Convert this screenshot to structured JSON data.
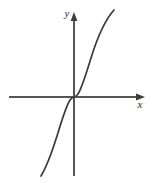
{
  "figure": {
    "title": "",
    "width": 153,
    "height": 183,
    "background_color": "#ffffff"
  },
  "axes": {
    "x_axis": {
      "label": "x",
      "label_style": "italic",
      "color": "#555555",
      "arrow": "right",
      "origin_y": 97,
      "start_x": 9,
      "end_x": 145,
      "label_x": 140,
      "label_y": 108
    },
    "y_axis": {
      "label": "y",
      "label_style": "italic",
      "color": "#555555",
      "arrow": "up",
      "origin_x": 74,
      "start_y": 176,
      "end_y": 12,
      "label_x": 67,
      "label_y": 17
    }
  },
  "chart_data": {
    "type": "line",
    "title": "",
    "xlabel": "x",
    "ylabel": "y",
    "grid": false,
    "legend": null,
    "curve_color": "#3a3a3a",
    "curve_width": 1.7,
    "function": "y = x^3",
    "xlim": [
      -3.3,
      4.0
    ],
    "ylim": [
      -8.5,
      8.7
    ],
    "x": [
      -2.05,
      -1.9,
      -1.75,
      -1.6,
      -1.45,
      -1.3,
      -1.15,
      -1.0,
      -0.85,
      -0.7,
      -0.55,
      -0.4,
      -0.25,
      0.0,
      0.25,
      0.4,
      0.55,
      0.7,
      0.85,
      1.0,
      1.15,
      1.3,
      1.45,
      1.6,
      1.75,
      1.9,
      2.05
    ],
    "y": [
      -8.62,
      -6.86,
      -5.36,
      -4.1,
      -3.05,
      -2.2,
      -1.52,
      -1.0,
      -0.61,
      -0.34,
      -0.17,
      -0.064,
      -0.016,
      0.0,
      0.016,
      0.064,
      0.17,
      0.34,
      0.61,
      1.0,
      1.52,
      2.2,
      3.05,
      4.1,
      5.36,
      6.86,
      8.62
    ],
    "pixel_path": "M 41,176 C 47,166 52,152 57,136 C 62,120 66,106 70,100 C 72,97.5 73,97 74,97 C 75,97 76,96.5 78,94 C 82,88 86,74 91,58 C 96,42 103,22 114,10",
    "pixel_anchors": {
      "start": [
        41,
        176
      ],
      "inflection": [
        74,
        97
      ],
      "end": [
        114,
        10
      ]
    }
  }
}
